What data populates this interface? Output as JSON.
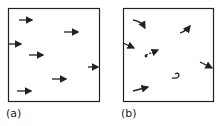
{
  "panels": [
    {
      "label": "(a)",
      "description": "uniform flow: parallel arrows pointing right"
    },
    {
      "label": "(b)",
      "description": "disordered flow: curved arrows in varied directions"
    }
  ]
}
